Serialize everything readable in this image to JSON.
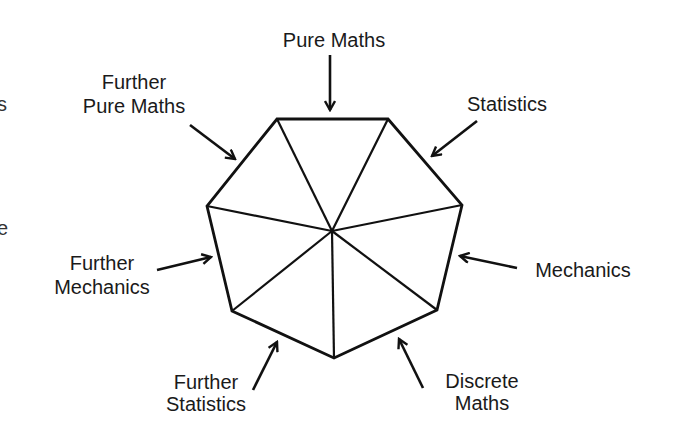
{
  "diagram": {
    "title": "",
    "stroke_color": "#111111",
    "text_color": "#1a1a1a",
    "center": {
      "x": 332,
      "y": 231
    },
    "vertices": [
      {
        "x": 277,
        "y": 119
      },
      {
        "x": 388,
        "y": 119
      },
      {
        "x": 462,
        "y": 205
      },
      {
        "x": 437,
        "y": 310
      },
      {
        "x": 334,
        "y": 358
      },
      {
        "x": 232,
        "y": 311
      },
      {
        "x": 207,
        "y": 206
      }
    ],
    "modules": [
      {
        "id": "pure-maths",
        "lines": [
          "Pure Maths"
        ],
        "arrow": {
          "x1": 330,
          "y1": 55,
          "x2": 330,
          "y2": 110
        }
      },
      {
        "id": "statistics",
        "lines": [
          "Statistics"
        ],
        "arrow": {
          "x1": 477,
          "y1": 121,
          "x2": 432,
          "y2": 156
        }
      },
      {
        "id": "mechanics",
        "lines": [
          "Mechanics"
        ],
        "arrow": {
          "x1": 517,
          "y1": 268,
          "x2": 460,
          "y2": 256
        }
      },
      {
        "id": "discrete-maths",
        "lines": [
          "Discrete",
          "Maths"
        ],
        "arrow": {
          "x1": 423,
          "y1": 388,
          "x2": 399,
          "y2": 339
        }
      },
      {
        "id": "further-statistics",
        "lines": [
          "Further",
          "Statistics"
        ],
        "arrow": {
          "x1": 253,
          "y1": 390,
          "x2": 277,
          "y2": 342
        }
      },
      {
        "id": "further-mechanics",
        "lines": [
          "Further",
          "Mechanics"
        ],
        "arrow": {
          "x1": 157,
          "y1": 270,
          "x2": 211,
          "y2": 257
        }
      },
      {
        "id": "further-pure-maths",
        "lines": [
          "Further",
          "Pure Maths"
        ],
        "arrow": {
          "x1": 190,
          "y1": 125,
          "x2": 235,
          "y2": 159
        }
      }
    ],
    "edge_fragments": [
      "s",
      "e"
    ]
  }
}
